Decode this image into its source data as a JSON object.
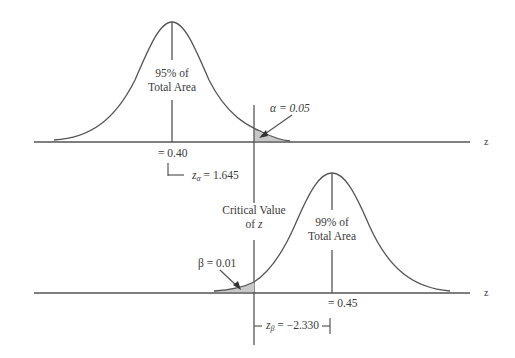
{
  "diagram": {
    "type": "two normal distributions - hypothesis test power illustration",
    "axis_label": "z",
    "top": {
      "area_label_line1": "95% of",
      "area_label_line2": "Total Area",
      "mean_label": "= 0.40",
      "alpha_label": "α = 0.05",
      "z_alpha_symbol": "z",
      "z_alpha_sub": "α",
      "z_alpha_value": " = 1.645"
    },
    "critical": {
      "line1": "Critical Value",
      "line2_prefix": "of ",
      "line2_var": "z"
    },
    "bottom": {
      "area_label_line1": "99% of",
      "area_label_line2": "Total Area",
      "mean_label": "= 0.45",
      "beta_label": "β = 0.01",
      "z_beta_symbol": "z",
      "z_beta_sub": "β",
      "z_beta_value": " = −2.330"
    },
    "colors": {
      "line": "#555555",
      "shade": "#c8c8c8",
      "text": "#3a3a3a"
    }
  }
}
